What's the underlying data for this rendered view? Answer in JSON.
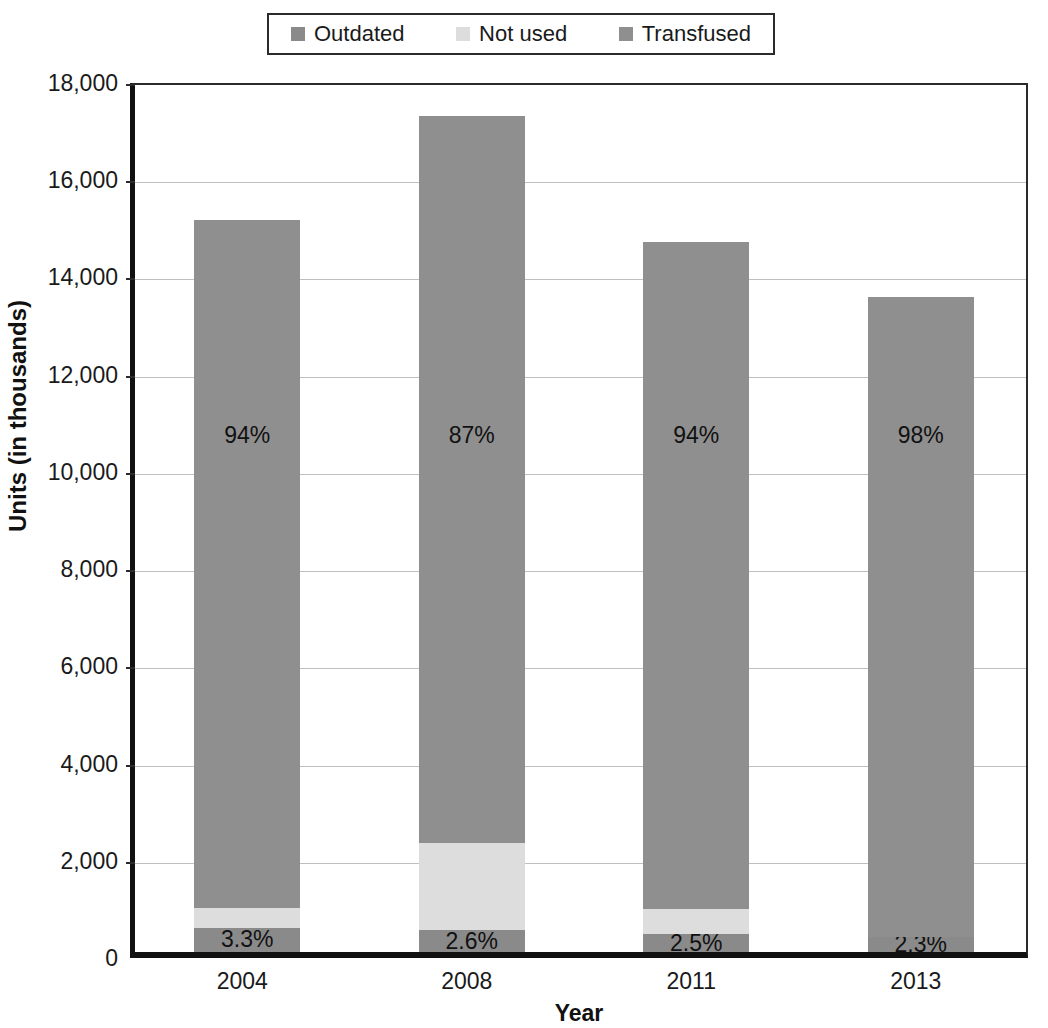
{
  "chart_data": {
    "type": "bar",
    "subtype": "stacked",
    "title": "",
    "xlabel": "Year",
    "ylabel": "Units (in thousands)",
    "categories": [
      "2004",
      "2008",
      "2011",
      "2013"
    ],
    "ylim": [
      0,
      18000
    ],
    "ytick_labels": [
      "0",
      "2,000",
      "4,000",
      "6,000",
      "8,000",
      "10,000",
      "12,000",
      "14,000",
      "16,000",
      "18,000"
    ],
    "ytick_values": [
      0,
      2000,
      4000,
      6000,
      8000,
      10000,
      12000,
      14000,
      16000,
      18000
    ],
    "grid": true,
    "legend_position": "top",
    "series": [
      {
        "name": "Outdated",
        "color": "#8a8a8a",
        "values": [
          497,
          447,
          365,
          310
        ],
        "labels": [
          "3.3%",
          "2.6%",
          "2.5%",
          "2.3%"
        ]
      },
      {
        "name": "Not used",
        "color": "#dddddd",
        "values": [
          406,
          1789,
          511,
          0
        ],
        "labels": [
          "",
          "",
          "",
          ""
        ]
      },
      {
        "name": "Transfused",
        "color": "#8f8f8f",
        "values": [
          14147,
          14964,
          13724,
          13160
        ],
        "labels": [
          "94%",
          "87%",
          "94%",
          "98%"
        ]
      }
    ],
    "totals": [
      15050,
      17200,
      14600,
      13470
    ]
  },
  "legend": {
    "items": [
      {
        "label": "Outdated",
        "color": "#8a8a8a"
      },
      {
        "label": "Not used",
        "color": "#dddddd"
      },
      {
        "label": "Transfused",
        "color": "#8f8f8f"
      }
    ]
  },
  "colors": {
    "outdated": "#8a8a8a",
    "not_used": "#dddddd",
    "transfused": "#8f8f8f",
    "axis": "#111111",
    "gridline": "#bfbfbf",
    "text": "#1a1a1a"
  }
}
